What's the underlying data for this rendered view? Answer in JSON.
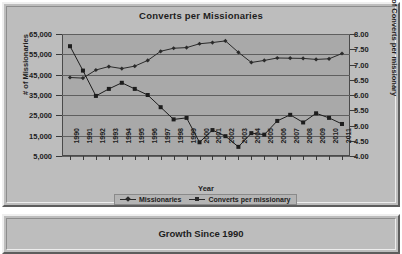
{
  "chart_panel": {
    "title": "Converts per Missionaries",
    "axis_x_title": "Year",
    "axis_y_left_title": "# of Missionaries",
    "axis_y_right_title": "# of Converts per missionary",
    "y_left_ticks": [
      "65,000",
      "55,000",
      "45,000",
      "35,000",
      "25,000",
      "15,000",
      "5,000"
    ],
    "y_right_ticks": [
      "8.00",
      "7.50",
      "7.00",
      "6.50",
      "6.00",
      "5.50",
      "5.00",
      "4.50",
      "4.00"
    ],
    "legend": [
      {
        "label": "Missionaries",
        "marker": "diamond-marker",
        "color": "#2a2a2a"
      },
      {
        "label": "Converts per missionary",
        "marker": "square-marker",
        "color": "#2a2a2a"
      }
    ]
  },
  "growth_panel": {
    "title": "Growth Since 1990"
  },
  "colors": {
    "plot_background": "#a9a9a9",
    "panel_background": "#bdbdbd",
    "gridline": "#5f5f5f",
    "series_missionaries": "#2a2a2a",
    "series_converts": "#1d1d1d",
    "text": "#1c1c1c"
  },
  "chart_data": {
    "type": "line",
    "title": "Converts per Missionaries",
    "xlabel": "Year",
    "ylabel": "# of Missionaries",
    "y2label": "# of Converts per missionary",
    "grid": true,
    "legend_position": "bottom",
    "categories": [
      "1990",
      "1991",
      "1992",
      "1993",
      "1994",
      "1995",
      "1996",
      "1997",
      "1998",
      "1999",
      "2000",
      "2001",
      "2002",
      "2003",
      "2004",
      "2005",
      "2006",
      "2007",
      "2008",
      "2009",
      "2010",
      "2011"
    ],
    "ylim": [
      5000,
      65000
    ],
    "y2lim": [
      4.0,
      8.0
    ],
    "series": [
      {
        "name": "Missionaries",
        "axis": "left",
        "marker": "diamond",
        "values": [
          43600,
          43300,
          47300,
          49000,
          48000,
          49200,
          52000,
          56500,
          58000,
          58300,
          60200,
          60800,
          61600,
          56000,
          51000,
          52000,
          53200,
          53100,
          53000,
          52500,
          52800,
          55400
        ]
      },
      {
        "name": "Converts per missionary",
        "axis": "right",
        "marker": "square",
        "values": [
          7.6,
          6.8,
          5.97,
          6.2,
          6.4,
          6.2,
          6.0,
          5.6,
          5.2,
          5.25,
          4.45,
          4.85,
          4.65,
          4.3,
          4.75,
          4.7,
          5.15,
          5.35,
          5.1,
          5.4,
          5.25,
          5.05
        ]
      }
    ]
  }
}
